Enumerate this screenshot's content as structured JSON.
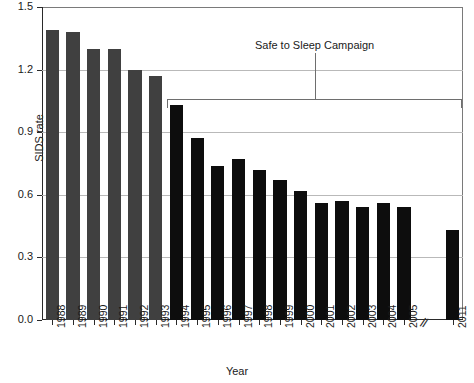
{
  "chart_data": {
    "type": "bar",
    "title": "",
    "xlabel": "Year",
    "ylabel": "SIDS rate",
    "ylim": [
      0.0,
      1.5
    ],
    "ytick_labels": [
      "1.5",
      "1.2",
      "0.9",
      "0.6",
      "0.3",
      "0.0"
    ],
    "ytick_values": [
      1.5,
      1.2,
      0.9,
      0.6,
      0.3,
      0.0
    ],
    "grid": "horizontal",
    "legend": "none",
    "axis_break": {
      "symbol": "//",
      "between": [
        "2006",
        "2011"
      ]
    },
    "categories": [
      "1988",
      "1989",
      "1990",
      "1991",
      "1992",
      "1993",
      "1994",
      "1995",
      "1996",
      "1997",
      "1998",
      "1999",
      "2000",
      "2001",
      "2002",
      "2003",
      "2004",
      "2005",
      "2011"
    ],
    "values": [
      1.39,
      1.38,
      1.3,
      1.3,
      1.2,
      1.17,
      1.03,
      0.87,
      0.74,
      0.77,
      0.72,
      0.67,
      0.62,
      0.56,
      0.57,
      0.54,
      0.56,
      0.54,
      0.43
    ],
    "bar_colors": [
      "#404040",
      "#404040",
      "#404040",
      "#404040",
      "#404040",
      "#404040",
      "#0d0d0d",
      "#0d0d0d",
      "#0d0d0d",
      "#0d0d0d",
      "#0d0d0d",
      "#0d0d0d",
      "#0d0d0d",
      "#0d0d0d",
      "#0d0d0d",
      "#0d0d0d",
      "#0d0d0d",
      "#0d0d0d",
      "#0d0d0d"
    ],
    "annotations": [
      {
        "text": "Safe to Sleep Campaign",
        "spans": [
          "1994",
          "2011"
        ],
        "bracket_y": 1.06
      }
    ],
    "colors": {
      "bar_pre_campaign": "#404040",
      "bar_post_campaign": "#0d0d0d",
      "gridline": "#b9b9b9",
      "axis": "#2a2a2a",
      "annotation": "#6e6e6e",
      "background": "#ffffff"
    }
  },
  "annotation": {
    "campaign_label": "Safe to Sleep Campaign"
  },
  "axis": {
    "x_title": "Year",
    "y_title": "SIDS rate",
    "break_symbol": "//"
  }
}
